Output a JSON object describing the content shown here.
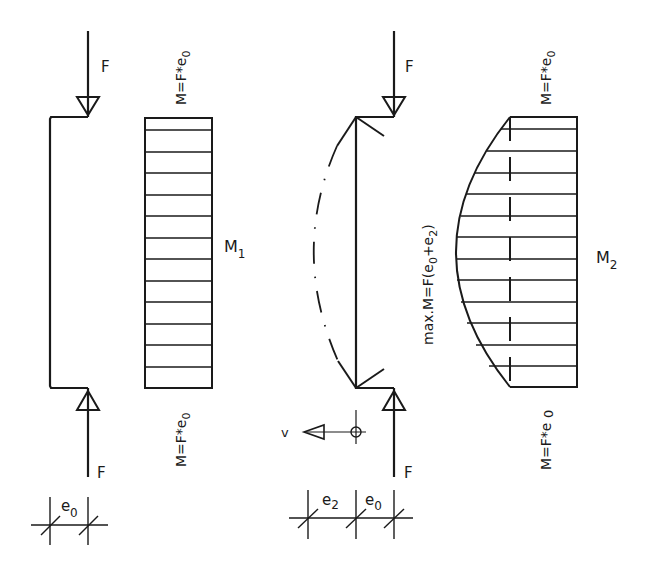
{
  "diagram": {
    "type": "structural-mechanics",
    "left": {
      "force_top_label": "F",
      "force_bottom_label": "F",
      "moment_top": "M=F*e0",
      "moment_bottom": "M=F*e0",
      "moment_diagram_label": "M1",
      "dimension_label": "e0"
    },
    "right": {
      "force_top_label": "F",
      "force_bottom_label": "F",
      "moment_top": "M=F*e0",
      "moment_bottom": "M=F*e0",
      "max_moment": "max.M=F(e0+e2)",
      "moment_diagram_label": "M2",
      "deflection_label": "v",
      "dimension_labels": [
        "e2",
        "e0"
      ]
    },
    "colors": {
      "ink": "#1a1a1a",
      "background": "#ffffff"
    }
  }
}
